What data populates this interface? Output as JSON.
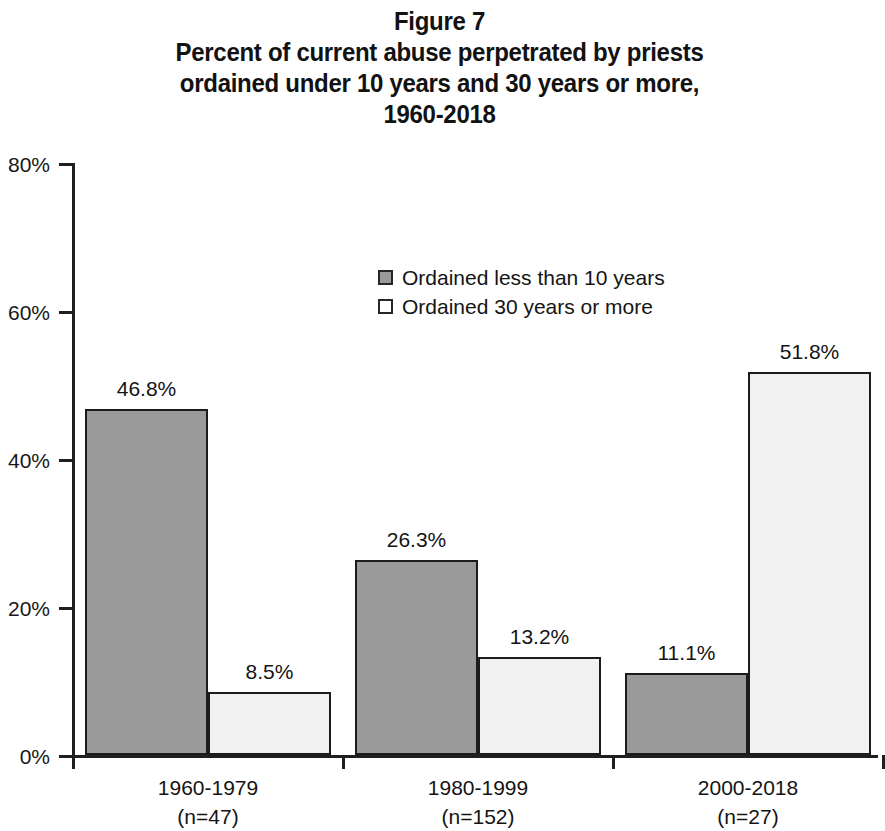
{
  "chart_data": {
    "type": "bar",
    "title": "Figure 7\nPercent of current abuse perpetrated by priests ordained under 10 years and 30 years or more, 1960-2018",
    "title_lines": [
      "Figure 7",
      "Percent of current abuse perpetrated by priests",
      "ordained under 10 years and 30 years or more,",
      "1960-2018"
    ],
    "xlabel": "",
    "ylabel": "",
    "ylim": [
      0,
      80
    ],
    "yticks": [
      0,
      20,
      40,
      60,
      80
    ],
    "ytick_labels": [
      "0%",
      "20%",
      "40%",
      "60%",
      "80%"
    ],
    "grid": false,
    "legend_position": "upper center",
    "categories": [
      "1960-1979",
      "1980-1999",
      "2000-2018"
    ],
    "category_sublabels": [
      "(n=47)",
      "(n=152)",
      "(n=27)"
    ],
    "series": [
      {
        "name": "Ordained less than 10 years",
        "color": "#9a9a9a",
        "values": [
          46.8,
          26.3,
          11.1
        ],
        "value_labels": [
          "46.8%",
          "26.3%",
          "11.1%"
        ]
      },
      {
        "name": "Ordained 30 years or more",
        "color": "#f1f1f1",
        "values": [
          8.5,
          13.2,
          51.8
        ],
        "value_labels": [
          "8.5%",
          "13.2%",
          "51.8%"
        ]
      }
    ]
  }
}
